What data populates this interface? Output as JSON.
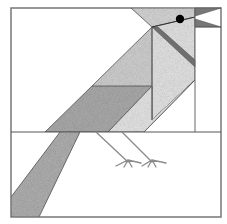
{
  "illustration": {
    "subject": "Quilt block: perched bird (cardinal-style) in geometric patchwork",
    "colors": {
      "background": "#ffffff",
      "outline": "#555555",
      "frame": "#777777",
      "fabric_light": "#e2e2e2",
      "fabric_medium": "#cfcfcf",
      "fabric_dark": "#a9a9a9",
      "accent_dark": "#6f6f6f",
      "eye": "#000000",
      "legs": "#8a8a8a"
    }
  }
}
